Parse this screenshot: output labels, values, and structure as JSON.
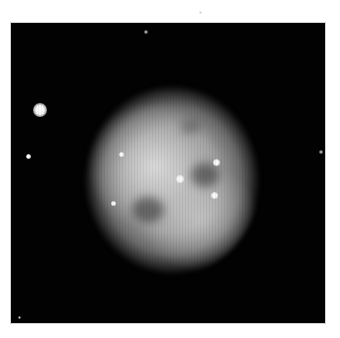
{
  "image": {
    "subject": "planetary nebula (owl-like) with surrounding stars",
    "background_color": "#ffffff",
    "frame": {
      "left": 11,
      "top": 23,
      "width": 314,
      "height": 300,
      "color": "#020202"
    },
    "nebula": {
      "center_x": 172,
      "center_y": 180,
      "radius_x": 88,
      "radius_y": 95,
      "color": "#b6b6b6"
    },
    "dark_eyes": [
      {
        "x": 205,
        "y": 175,
        "rx": 14,
        "ry": 12
      },
      {
        "x": 148,
        "y": 210,
        "rx": 16,
        "ry": 13
      },
      {
        "x": 190,
        "y": 127,
        "rx": 10,
        "ry": 7
      }
    ],
    "stars": [
      {
        "name": "bright-left",
        "x": 40,
        "y": 110,
        "size": 14
      },
      {
        "name": "faint-left",
        "x": 28,
        "y": 156,
        "size": 5
      },
      {
        "name": "top",
        "x": 146,
        "y": 32,
        "size": 4
      },
      {
        "name": "right-edge",
        "x": 321,
        "y": 152,
        "size": 4
      },
      {
        "name": "central",
        "x": 180,
        "y": 179,
        "size": 8
      },
      {
        "name": "upper-right-in-nebula",
        "x": 216,
        "y": 162,
        "size": 7
      },
      {
        "name": "lower-right-in-nebula",
        "x": 214,
        "y": 195,
        "size": 7
      },
      {
        "name": "left-in-nebula",
        "x": 121,
        "y": 154,
        "size": 5
      },
      {
        "name": "lower-left-in-nebula",
        "x": 113,
        "y": 203,
        "size": 5
      },
      {
        "name": "bottom-left-corner",
        "x": 19,
        "y": 317,
        "size": 3
      }
    ],
    "outer_specks": [
      {
        "x": 200,
        "y": 12,
        "size": 3
      }
    ]
  }
}
